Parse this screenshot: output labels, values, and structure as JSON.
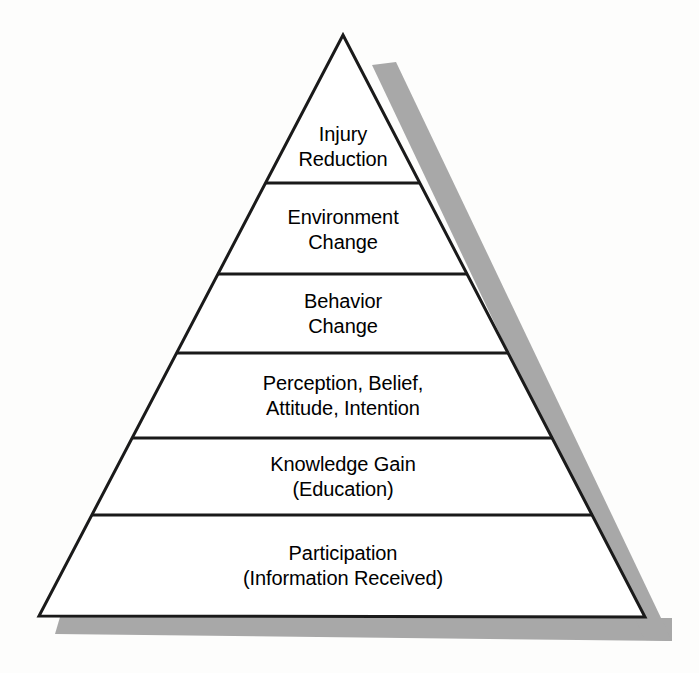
{
  "diagram": {
    "name": "injury-prevention-pyramid",
    "type": "pyramid-hierarchy",
    "background_color": "#fdfdfc",
    "outline_color": "#1a1a1a",
    "fill_color": "#ffffff",
    "shadow_color": "#a8a8a8",
    "text_color": "#000000",
    "apex": {
      "x": 343,
      "y": 35
    },
    "base_left": {
      "x": 39,
      "y": 616
    },
    "base_right": {
      "x": 645,
      "y": 617
    },
    "divider_y": [
      183,
      274,
      353,
      438,
      515
    ],
    "levels": [
      {
        "index": 1,
        "position": "top",
        "name": "injury-reduction",
        "lines": [
          "Injury",
          "Reduction"
        ],
        "center_x": 343,
        "center_y": 147
      },
      {
        "index": 2,
        "position": "second",
        "name": "environment-change",
        "lines": [
          "Environment",
          "Change"
        ],
        "center_x": 343,
        "center_y": 230
      },
      {
        "index": 3,
        "position": "third",
        "name": "behavior-change",
        "lines": [
          "Behavior",
          "Change"
        ],
        "center_x": 343,
        "center_y": 314
      },
      {
        "index": 4,
        "position": "fourth",
        "name": "perception-belief-attitude-intention",
        "lines": [
          "Perception, Belief,",
          "Attitude, Intention"
        ],
        "center_x": 343,
        "center_y": 396
      },
      {
        "index": 5,
        "position": "fifth",
        "name": "knowledge-gain-education",
        "lines": [
          "Knowledge Gain",
          "(Education)"
        ],
        "center_x": 343,
        "center_y": 477
      },
      {
        "index": 6,
        "position": "base",
        "name": "participation-information-received",
        "lines": [
          "Participation",
          "(Information Received)"
        ],
        "center_x": 343,
        "center_y": 566
      }
    ]
  }
}
